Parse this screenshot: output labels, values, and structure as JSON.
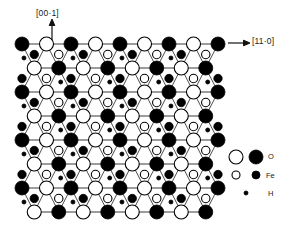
{
  "figure": {
    "type": "crystal-structure-projection",
    "background": "#ffffff",
    "ink": "#000000",
    "bond_color": "#333333"
  },
  "axes": {
    "vertical": {
      "label": "[00·1]",
      "direction": "up",
      "arrow": "up-arrow-icon",
      "x": 36,
      "y": 8,
      "arrow_x": 52,
      "arrow_y1": 22,
      "arrow_y2": 40
    },
    "horizontal": {
      "label": "[11·0]",
      "direction": "right",
      "arrow": "right-arrow-icon",
      "x": 252,
      "y": 36,
      "arrow_x1": 228,
      "arrow_x2": 250,
      "arrow_y": 43
    }
  },
  "lattice": {
    "rows": 8,
    "cols": 9,
    "x_start": 22,
    "y_start": 44,
    "x_spacing": 24.5,
    "y_spacing": 24.0,
    "row_offset": 12.25,
    "large_radius": 7.0,
    "medium_radius": 4.2,
    "small_radius": 2.0,
    "row_parity_start": [
      "filled",
      "open",
      "filled",
      "open",
      "filled",
      "open",
      "filled",
      "open"
    ]
  },
  "legend": {
    "title": "",
    "rows": [
      {
        "id": "legend-row-oxygen",
        "label": "O",
        "symbols": [
          {
            "kind": "open-circle",
            "r": 7.0,
            "cx": 236,
            "cy": 157
          },
          {
            "kind": "filled-circle",
            "r": 7.0,
            "cx": 256,
            "cy": 157
          }
        ],
        "label_x": 268,
        "label_y": 152
      },
      {
        "id": "legend-row-iron",
        "label": "Fe",
        "symbols": [
          {
            "kind": "open-circle",
            "r": 4.0,
            "cx": 236,
            "cy": 175
          },
          {
            "kind": "filled-circle",
            "r": 4.0,
            "cx": 256,
            "cy": 175
          }
        ],
        "label_x": 266,
        "label_y": 171
      },
      {
        "id": "legend-row-hydrogen",
        "label": "H",
        "symbols": [
          {
            "kind": "filled-circle",
            "r": 2.0,
            "cx": 246,
            "cy": 193
          }
        ],
        "label_x": 268,
        "label_y": 189
      }
    ]
  },
  "chart_data": {
    "type": "scatter",
    "title": "",
    "xlabel": "[11·0]",
    "ylabel": "[00·1]",
    "legend_position": "right",
    "series": [
      {
        "name": "O (filled)",
        "marker": "filled-circle",
        "size": "large",
        "count": 36
      },
      {
        "name": "O (open)",
        "marker": "open-circle",
        "size": "large",
        "count": 36
      },
      {
        "name": "Fe (filled)",
        "marker": "filled-circle",
        "size": "medium",
        "count": 28
      },
      {
        "name": "Fe (open)",
        "marker": "open-circle",
        "size": "medium",
        "count": 28
      },
      {
        "name": "H",
        "marker": "filled-circle",
        "size": "small",
        "count": 24
      }
    ]
  }
}
